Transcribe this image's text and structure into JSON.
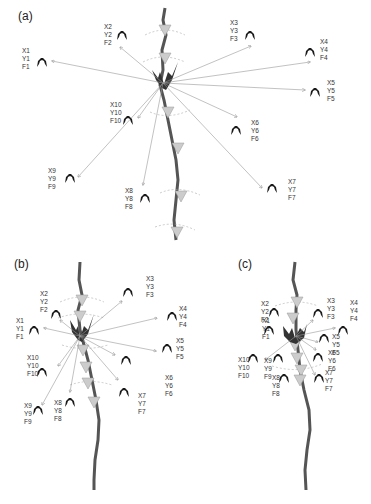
{
  "panels": [
    {
      "id": "a",
      "label": "(a)",
      "receivers": [
        {
          "x": "X1",
          "y": "Y1",
          "f": "F1"
        },
        {
          "x": "X2",
          "y": "Y2",
          "f": "F2"
        },
        {
          "x": "X3",
          "y": "Y3",
          "f": "F3"
        },
        {
          "x": "X4",
          "y": "Y4",
          "f": "F4"
        },
        {
          "x": "X5",
          "y": "Y5",
          "f": "F5"
        },
        {
          "x": "X6",
          "y": "Y6",
          "f": "F6"
        },
        {
          "x": "X7",
          "y": "Y7",
          "f": "F7"
        },
        {
          "x": "X8",
          "y": "Y8",
          "f": "F8"
        },
        {
          "x": "X9",
          "y": "Y9",
          "f": "F9"
        },
        {
          "x": "X10",
          "y": "Y10",
          "f": "F10"
        }
      ]
    },
    {
      "id": "b",
      "label": "(b)"
    },
    {
      "id": "c",
      "label": "(c)"
    }
  ],
  "colors": {
    "stream": "#555555",
    "arrow": "#999999",
    "marker": "#cccccc",
    "creature": "#1a1a1a"
  }
}
